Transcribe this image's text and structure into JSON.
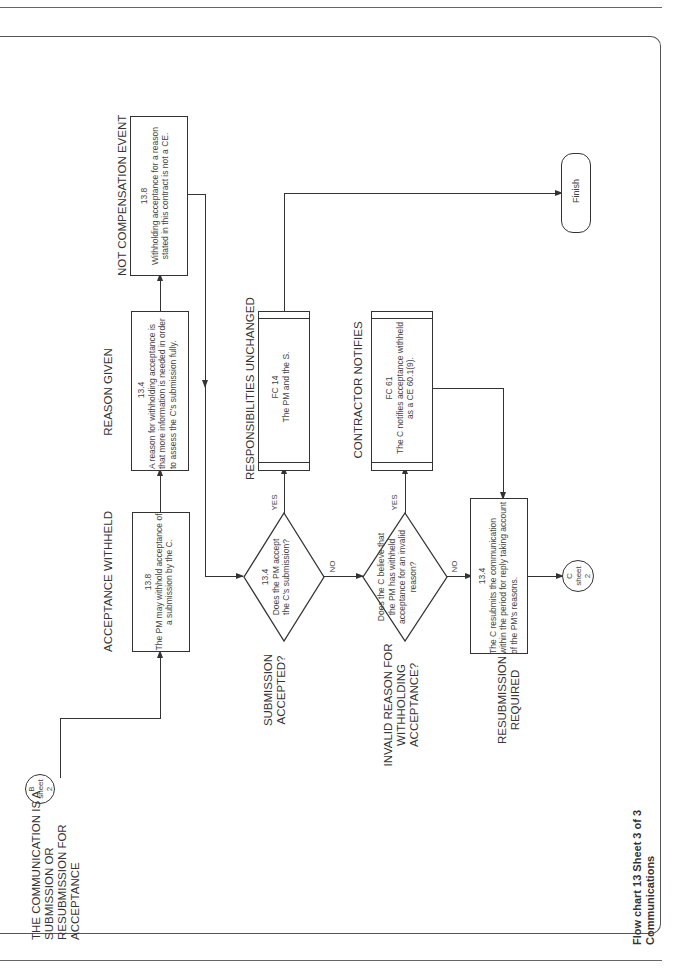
{
  "page": {
    "footer_title": "Flow chart 13   Sheet 3 of 3",
    "footer_subtitle": "Communications"
  },
  "connectors": {
    "start": {
      "letter": "B",
      "word": "sheet",
      "num": "2"
    },
    "end": {
      "letter": "C",
      "word": "sheet",
      "num": "2"
    }
  },
  "side_labels": {
    "communication": "THE COMMUNICATION IS A SUBMISSION OR RESUBMISSION FOR ACCEPTANCE",
    "submission_accepted": "SUBMISSION ACCEPTED?",
    "invalid_reason": "INVALID REASON FOR WITHHOLDING ACCEPTANCE?",
    "resubmission_required": "RESUBMISSION REQUIRED"
  },
  "boxes": {
    "acceptance_withheld": {
      "heading": "ACCEPTANCE WITHHELD",
      "clause": "13.8",
      "text": "The PM may withhold acceptance of a submission by the C."
    },
    "reason_given": {
      "heading": "REASON GIVEN",
      "clause": "13.4",
      "text": "A reason for withholding acceptance is that more information is needed in order to assess the C's submission fully."
    },
    "not_compensation_event": {
      "heading": "NOT COMPENSATION EVENT",
      "clause": "13.8",
      "text": "Withholding acceptance for a reason stated in this contract is not a CE."
    },
    "responsibilities_unchanged": {
      "heading": "RESPONSIBILITIES UNCHANGED",
      "clause": "FC 14",
      "text": "The PM and the S."
    },
    "contractor_notifies": {
      "heading": "CONTRACTOR NOTIFIES",
      "clause": "FC 61",
      "text": "The C notifies acceptance withheld as a CE 60.1(9)."
    },
    "resubmission": {
      "clause": "13.4",
      "text": "The C resubmits the communication within the period for reply taking account of the PM's reasons."
    }
  },
  "decisions": {
    "accept": {
      "clause": "13.4",
      "text": "Does the PM accept the C's submission?",
      "yes": "YES",
      "no": "NO"
    },
    "invalid": {
      "text": "Does the C believe that the PM has withheld acceptance for an invalid reason?",
      "yes": "YES",
      "no": "NO"
    }
  },
  "terminal": {
    "finish": "Finish"
  }
}
